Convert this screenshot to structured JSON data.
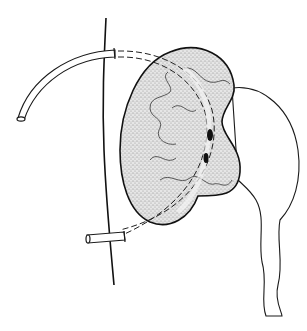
{
  "figure": {
    "type": "medical line illustration",
    "width": 307,
    "height": 331,
    "colors": {
      "background": "#ffffff",
      "ink": "#1a1a1a",
      "stipple": "#9a9a9a",
      "kidney_fill": "#d8d8d8",
      "tube_fill": "#ffffff"
    },
    "elements": [
      {
        "name": "body-wall-line"
      },
      {
        "name": "kidney-parenchyma"
      },
      {
        "name": "renal-calyces"
      },
      {
        "name": "renal-pelvis"
      },
      {
        "name": "ureter"
      },
      {
        "name": "catheter-tube-upper-external"
      },
      {
        "name": "catheter-tube-lower-external"
      },
      {
        "name": "catheter-tube-internal-dashed"
      },
      {
        "name": "catheter-side-holes"
      }
    ]
  }
}
